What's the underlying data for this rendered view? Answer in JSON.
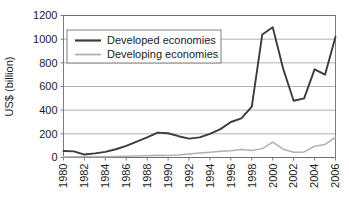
{
  "chart_data": {
    "type": "line",
    "title": "",
    "subtitle": "",
    "xlabel": "",
    "ylabel": "US$ (billion)",
    "xlim": [
      1980,
      2006
    ],
    "ylim": [
      0,
      1200
    ],
    "ytick_values": [
      0,
      200,
      400,
      600,
      800,
      1000,
      1200
    ],
    "ytick_labels": [
      "0",
      "200",
      "400",
      "600",
      "800",
      "1000",
      "1200"
    ],
    "xtick_values": [
      1980,
      1982,
      1984,
      1986,
      1988,
      1990,
      1992,
      1994,
      1996,
      1998,
      2000,
      2002,
      2004,
      2006
    ],
    "xtick_labels": [
      "1980",
      "1982",
      "1984",
      "1986",
      "1988",
      "1990",
      "1992",
      "1994",
      "1996",
      "1998",
      "2000",
      "2002",
      "2004",
      "2006"
    ],
    "xtick_rotation": 90,
    "grid": "horizontal",
    "legend_position": "upper-left-inside",
    "x": [
      1980,
      1981,
      1982,
      1983,
      1984,
      1985,
      1986,
      1987,
      1988,
      1989,
      1990,
      1991,
      1992,
      1993,
      1994,
      1995,
      1996,
      1997,
      1998,
      1999,
      2000,
      2001,
      2002,
      2003,
      2004,
      2005,
      2006
    ],
    "series": [
      {
        "name": "Developed economies",
        "color": "#3c3c3c",
        "width": 1.9,
        "values": [
          55,
          52,
          25,
          35,
          48,
          70,
          98,
          135,
          170,
          210,
          205,
          180,
          160,
          170,
          200,
          240,
          300,
          330,
          430,
          1040,
          1100,
          750,
          480,
          500,
          745,
          700,
          1020
        ]
      },
      {
        "name": "Developing economies",
        "color": "#b0b0b0",
        "width": 1.5,
        "values": [
          5,
          6,
          7,
          6,
          6,
          8,
          10,
          12,
          14,
          18,
          16,
          22,
          30,
          38,
          45,
          52,
          58,
          68,
          60,
          75,
          130,
          70,
          45,
          47,
          95,
          110,
          170
        ]
      }
    ]
  },
  "legend": {
    "entries": [
      {
        "label": "Developed economies"
      },
      {
        "label": "Developing economies"
      }
    ]
  },
  "colors": {
    "developed": "#3c3c3c",
    "developing": "#b0b0b0",
    "grid": "#a9a9a9",
    "axis": "#6e6e6e",
    "text": "#1c1c1c",
    "background": "#ffffff",
    "legend_border": "#707070"
  }
}
